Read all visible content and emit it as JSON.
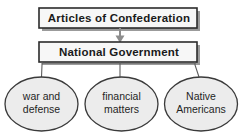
{
  "diagram": {
    "type": "hierarchy-flowchart",
    "title_box": {
      "label": "Articles of Confederation",
      "shape": "rectangle",
      "fill": "#f7f7f7",
      "border": "#2b2b2b",
      "shadow": "#9b9b9b"
    },
    "second_box": {
      "label": "National Government",
      "shape": "rectangle",
      "fill": "#f7f7f7",
      "border": "#2b2b2b",
      "shadow": "#9b9b9b"
    },
    "arrow": {
      "name": "down-arrow",
      "from": "Articles of Confederation",
      "to": "National Government",
      "color": "#8d8d8d"
    },
    "branches": [
      {
        "line1": "war and",
        "line2": "defense",
        "shape": "ellipse",
        "fill": "#ececec",
        "border": "#3a3a3a"
      },
      {
        "line1": "financial",
        "line2": "matters",
        "shape": "ellipse",
        "fill": "#ececec",
        "border": "#3a3a3a"
      },
      {
        "line1": "Native",
        "line2": "Americans",
        "shape": "ellipse",
        "fill": "#ececec",
        "border": "#3a3a3a"
      }
    ],
    "connector_color": "#5c5c5c",
    "background": "#ffffff"
  }
}
